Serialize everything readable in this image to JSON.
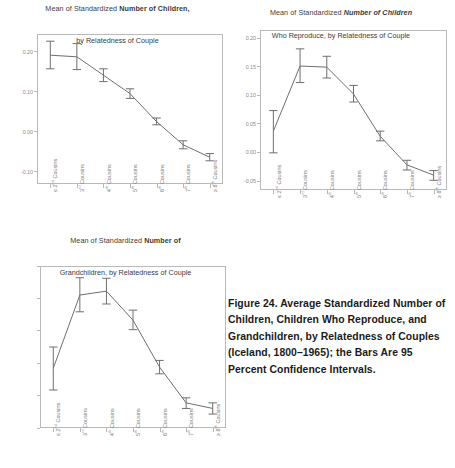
{
  "figure": {
    "caption": "Figure 24. Average Standardized Number of Children, Children Who Reproduce, and Grandchildren, by Relatedness of Couples (Iceland, 1800–1965); the Bars Are 95 Percent Confidence Intervals."
  },
  "categories_html": [
    "≤ 2<sup>nd</sup> Cousins",
    "3<sup>rd</sup> Cousins",
    "4<sup>th</sup> Cousins",
    "5<sup>th</sup> Cousins",
    "6<sup>th</sup> Cousins",
    "7<sup>th</sup> Cousins",
    "≥ 8<sup>th</sup> Cousins"
  ],
  "chart_data": [
    {
      "id": "children",
      "type": "line",
      "title_line1_plain": "Mean of Standardized ",
      "title_line1_bold": "Number of Children,",
      "title_line2_plain": "by ",
      "title_line2_bold": "Relatedness of Couple",
      "title_inside_frame": false,
      "categories": [
        "≤ 2nd Cousins",
        "3rd Cousins",
        "4th Cousins",
        "5th Cousins",
        "6th Cousins",
        "7th Cousins",
        "≥ 8th Cousins"
      ],
      "values": [
        0.192,
        0.188,
        0.142,
        0.096,
        0.026,
        -0.032,
        -0.063
      ],
      "ci_lower": [
        0.158,
        0.156,
        0.126,
        0.084,
        0.018,
        -0.042,
        -0.072
      ],
      "ci_upper": [
        0.227,
        0.221,
        0.158,
        0.108,
        0.035,
        -0.022,
        -0.054
      ],
      "ylabel": "",
      "xlabel": "",
      "yticks": [
        0.2,
        0.1,
        0.0,
        -0.1
      ],
      "ytick_labels": [
        "0.20",
        "0.10",
        "0.00",
        "-0.10"
      ],
      "ylim": [
        -0.13,
        0.245
      ],
      "grid": false,
      "legend": "none"
    },
    {
      "id": "children-who-reproduce",
      "type": "line",
      "title_line1_plain": "Mean of Standardized ",
      "title_line1_bold": "Number of Children",
      "title_line2_bold_a": "Who Reproduce",
      "title_line2_plain": ", by ",
      "title_line2_bold_b": "Relatedness of Couple",
      "title_inside_frame": true,
      "categories": [
        "≤ 2nd Cousins",
        "3rd Cousins",
        "4th Cousins",
        "5th Cousins",
        "6th Cousins",
        "7th Cousins",
        "≥ 8th Cousins"
      ],
      "values": [
        0.038,
        0.152,
        0.15,
        0.103,
        0.029,
        -0.021,
        -0.039
      ],
      "ci_lower": [
        0.0,
        0.123,
        0.131,
        0.089,
        0.021,
        -0.03,
        -0.048
      ],
      "ci_upper": [
        0.074,
        0.182,
        0.169,
        0.118,
        0.038,
        -0.013,
        -0.031
      ],
      "ylabel": "",
      "xlabel": "",
      "yticks": [
        0.2,
        0.15,
        0.1,
        0.05,
        0.0,
        -0.05
      ],
      "ytick_labels": [
        "0.20",
        "0.15",
        "0.10",
        "0.05",
        "0.00",
        "-0.05"
      ],
      "ylim": [
        -0.065,
        0.215
      ],
      "grid": false,
      "legend": "none"
    },
    {
      "id": "grandchildren",
      "type": "line",
      "title_line1_plain": "Mean of Standardized ",
      "title_line1_bold": "Number of",
      "title_line2_bold_a": "Grandchildren",
      "title_line2_plain": ", by ",
      "title_line2_bold_b": "Relatedness of Couple",
      "title_inside_frame": true,
      "categories": [
        "≤ 2nd Cousins",
        "3rd Cousins",
        "4th Cousins",
        "5th Cousins",
        "6th Cousins",
        "7th Cousins",
        "≥ 8th Cousins"
      ],
      "values": [
        0.052,
        0.183,
        0.19,
        0.138,
        0.054,
        -0.01,
        -0.02
      ],
      "ci_lower": [
        0.013,
        0.153,
        0.167,
        0.121,
        0.042,
        -0.02,
        -0.03
      ],
      "ci_upper": [
        0.09,
        0.214,
        0.213,
        0.156,
        0.066,
        -0.001,
        -0.01
      ],
      "ylabel": "",
      "xlabel": "",
      "yticks": [],
      "ytick_labels": [],
      "ytick_count": 6,
      "ylim": [
        -0.055,
        0.235
      ],
      "grid": false,
      "legend": "none"
    }
  ]
}
